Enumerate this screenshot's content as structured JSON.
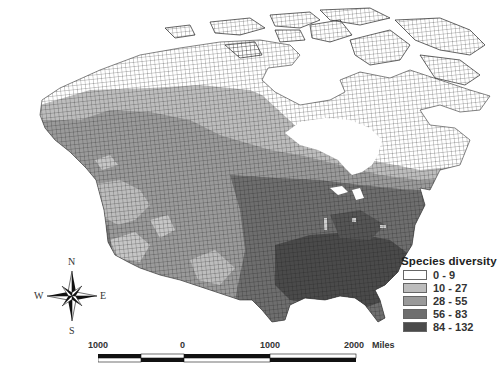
{
  "map": {
    "title": "Species diversity map of North America",
    "region": "North America (Canada, USA, northern Mexico)",
    "projection_note": "grid-cell map, conic projection"
  },
  "legend": {
    "title": "Species diversity",
    "classes": [
      {
        "label": "0 - 9",
        "color": "#ffffff"
      },
      {
        "label": "10 - 27",
        "color": "#bdbdbd"
      },
      {
        "label": "28 - 55",
        "color": "#9a9a9a"
      },
      {
        "label": "56 - 83",
        "color": "#6e6e6e"
      },
      {
        "label": "84 - 132",
        "color": "#4a4a4a"
      }
    ]
  },
  "compass": {
    "n": "N",
    "s": "S",
    "e": "E",
    "w": "W"
  },
  "scalebar": {
    "labels": [
      "1000",
      "0",
      "1000",
      "2000"
    ],
    "units": "Miles"
  },
  "colors": {
    "grid_line": "#1a1a1a",
    "water": "#ffffff"
  }
}
